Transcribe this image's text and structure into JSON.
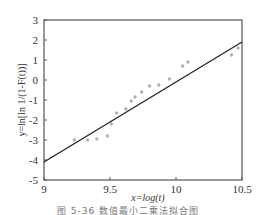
{
  "chart_data": {
    "type": "scatter",
    "title": "",
    "xlabel": "x=log(t)",
    "ylabel": "y=ln[ln 1/(1-F(t))]",
    "xlim": [
      9,
      10.5
    ],
    "ylim": [
      -5,
      3
    ],
    "xticks": [
      "9",
      "9.5",
      "10",
      "10.5"
    ],
    "xtick_values": [
      9,
      9.5,
      10,
      10.5
    ],
    "yticks": [
      "3",
      "2",
      "1",
      "0",
      "-1",
      "-2",
      "-3",
      "-4",
      "-5"
    ],
    "ytick_values": [
      3,
      2,
      1,
      0,
      -1,
      -2,
      -3,
      -4,
      -5
    ],
    "grid": false,
    "series": [
      {
        "name": "data points",
        "kind": "scatter",
        "color": "#b0b0b0",
        "points": [
          {
            "x": 9.23,
            "y": -3.0
          },
          {
            "x": 9.33,
            "y": -3.0
          },
          {
            "x": 9.4,
            "y": -2.95
          },
          {
            "x": 9.48,
            "y": -2.8
          },
          {
            "x": 9.51,
            "y": -2.2
          },
          {
            "x": 9.55,
            "y": -1.65
          },
          {
            "x": 9.62,
            "y": -1.45
          },
          {
            "x": 9.66,
            "y": -1.05
          },
          {
            "x": 9.69,
            "y": -0.85
          },
          {
            "x": 9.74,
            "y": -0.6
          },
          {
            "x": 9.8,
            "y": -0.3
          },
          {
            "x": 9.87,
            "y": -0.25
          },
          {
            "x": 9.95,
            "y": 0.05
          },
          {
            "x": 10.05,
            "y": 0.7
          },
          {
            "x": 10.09,
            "y": 0.9
          },
          {
            "x": 10.42,
            "y": 1.25
          },
          {
            "x": 10.47,
            "y": 1.6
          }
        ]
      },
      {
        "name": "fit line",
        "kind": "line",
        "color": "#222222",
        "points": [
          {
            "x": 9.0,
            "y": -4.1
          },
          {
            "x": 10.5,
            "y": 1.9
          }
        ]
      }
    ],
    "caption": "图 5-36  数值最小二乘法拟合图"
  }
}
